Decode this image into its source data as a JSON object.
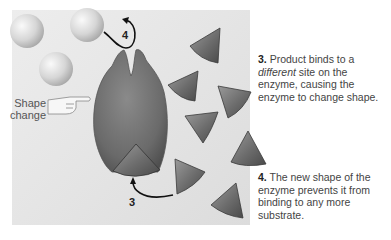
{
  "diagram": {
    "labels": {
      "shape_change": [
        "Shape",
        "change"
      ],
      "arrow_3": "3",
      "arrow_4": "4"
    },
    "steps": [
      {
        "number": "3.",
        "text_before": "Product binds to a ",
        "emphasis": "different",
        "text_after": " site on the enzyme, causing the enzyme to change shape."
      },
      {
        "number": "4.",
        "text": "The new shape of the enzyme prevents it from binding to any more substrate."
      }
    ],
    "elements": {
      "products": "3 spheres (product molecules)",
      "enzyme": "enzyme with altered shape",
      "substrates": "triangular substrate molecules",
      "pointer": "pointing hand icon"
    },
    "colors": {
      "panel": "#e4e4e4",
      "enzyme": "#6e6e6e",
      "substrate": "#6a6a6a",
      "sphere": "#d8d8d8",
      "text": "#444444"
    }
  }
}
